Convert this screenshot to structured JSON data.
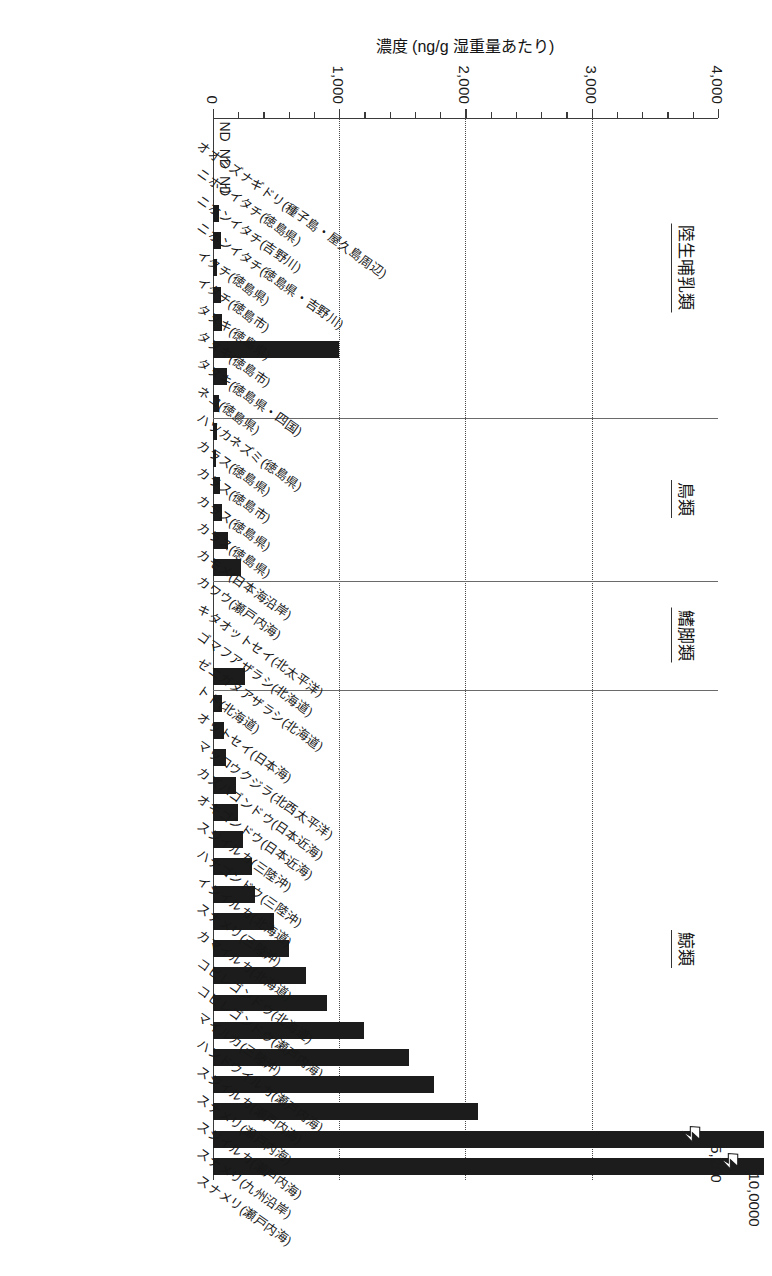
{
  "chart_data": {
    "type": "bar",
    "orientation": "vertical-printed-sideways",
    "title": "",
    "xlabel": "",
    "ylabel": "濃度 (ng/g 湿重量あたり)",
    "ylim": [
      0,
      4000
    ],
    "yticks": [
      0,
      1000,
      2000,
      3000,
      4000
    ],
    "ytick_labels": [
      "0",
      "1,000",
      "2,000",
      "3,000",
      "4,000"
    ],
    "minor_tick_step": 200,
    "grid": "dotted vertical gridlines at 1,000 / 2,000 / 3,000",
    "legend": "none",
    "bar_color": "#1c1c1c",
    "groups": [
      {
        "label": "陸生哺乳類",
        "count": 11
      },
      {
        "label": "鳥類",
        "count": 6
      },
      {
        "label": "鰭脚類",
        "count": 4
      },
      {
        "label": "鯨類",
        "count": 19
      }
    ],
    "categories": [
      "オオミズナギドリ(種子島・屋久島周辺)",
      "ニホンイタチ(徳島県)",
      "ニホンイタチ(吉野川)",
      "ニホンイタチ(徳島県・吉野川)",
      "イタチ(徳島県)",
      "イタチ(徳島市)",
      "タヌキ(徳島県)",
      "タヌキ(徳島市)",
      "タヌキ(徳島県・四国)",
      "ネコ(徳島県)",
      "ハツカネズミ(徳島県)",
      "カラス(徳島県)",
      "カラス(徳島市)",
      "カラス(徳島県)",
      "カラス(徳島県)",
      "カモメ(日本海沿岸)",
      "カワウ(瀬戸内海)",
      "キタオットセイ(北太平洋)",
      "ゴマフアザラシ(北海道)",
      "ゼニガタアザラシ(北海道)",
      "トド(北海道)",
      "オットセイ(日本海)",
      "マッコウクジラ(北西太平洋)",
      "カズハゴンドウ(日本近海)",
      "オキゴンドウ(日本近海)",
      "スジイルカ(三陸沖)",
      "ハナゴンドウ(三陸沖)",
      "イシイルカ(北海道)",
      "スナメリ(三陸沖)",
      "カマイルカ(北海道)",
      "コビレゴンドウ(北海道)",
      "コビレゴンドウ(瀬戸内海)",
      "マイルカ(三陸沖)",
      "ハンドウイルカ(瀬戸内海)",
      "スジイルカ(瀬戸内海)",
      "スナメリ(瀬戸内海)",
      "スジイルカ(瀬戸内海)",
      "スナメリ(九州沿岸)",
      "スナメリ(瀬戸内海)"
    ],
    "values": [
      0,
      0,
      0,
      50,
      60,
      35,
      60,
      70,
      1000,
      110,
      45,
      30,
      25,
      55,
      70,
      120,
      220,
      0,
      0,
      0,
      250,
      70,
      90,
      100,
      180,
      200,
      240,
      310,
      330,
      480,
      600,
      740,
      900,
      1200,
      1550,
      1750,
      2100,
      3380,
      10000
    ],
    "broken_bars": [
      {
        "index": 38,
        "label": "10,0000",
        "actual": 10000
      },
      {
        "index": 37,
        "label": "5,200",
        "actual": 5200
      }
    ],
    "nd_categories": [
      0,
      1,
      2
    ],
    "nd_label": "ND"
  },
  "axis": {
    "value_ticks": [
      {
        "value": 4000,
        "label": "4,000"
      },
      {
        "value": 3000,
        "label": "3,000"
      },
      {
        "value": 2000,
        "label": "2,000"
      },
      {
        "value": 1000,
        "label": "1,000"
      },
      {
        "value": 0,
        "label": "0"
      }
    ],
    "title": "濃度 (ng/g 湿重量あたり)"
  },
  "groups": [
    {
      "label": "陸生哺乳類"
    },
    {
      "label": "鳥類"
    },
    {
      "label": "鰭脚類"
    },
    {
      "label": "鯨類"
    }
  ],
  "break_markers": [
    {
      "label": "10,0000"
    },
    {
      "label": "5,200"
    }
  ],
  "nd": {
    "label": "ND",
    "count": 3
  }
}
